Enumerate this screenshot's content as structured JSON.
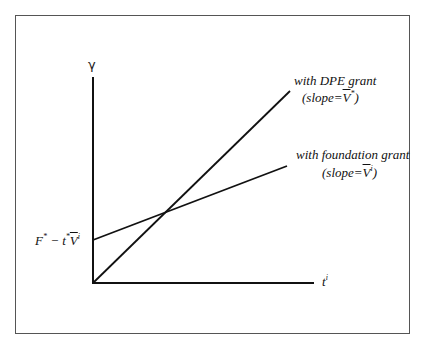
{
  "diagram": {
    "type": "line-diagram",
    "y_axis_label": "γ",
    "x_axis_label": "t",
    "x_axis_label_superscript": "i",
    "intercept_label": {
      "F": "F",
      "F_sup": "*",
      "minus": " − t",
      "t_sup": "*",
      "V": "V",
      "V_sup": "i"
    },
    "lines": [
      {
        "name": "with DPE grant",
        "slope_prefix": "(slope=",
        "slope_symbol": "V",
        "slope_sup": "*",
        "slope_suffix": ")",
        "starts_at": "origin",
        "steepness": "steep"
      },
      {
        "name": "with foundation grant",
        "slope_prefix": "(slope=",
        "slope_symbol": "V",
        "slope_sup": "i",
        "slope_suffix": ")",
        "starts_at": "F* - t*V̄i intercept",
        "steepness": "shallow"
      }
    ],
    "colors": {
      "lines": "#111111",
      "frame": "#555555",
      "background": "#ffffff"
    }
  }
}
